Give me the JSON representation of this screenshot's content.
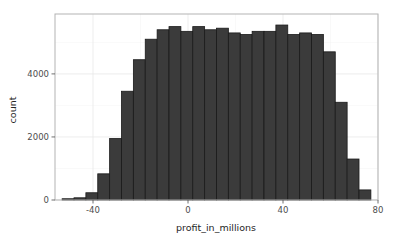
{
  "chart_data": {
    "type": "bar",
    "subtype": "histogram",
    "title": "",
    "xlabel": "profit_in_millions",
    "ylabel": "count",
    "xlim": [
      -56,
      80
    ],
    "ylim": [
      0,
      5900
    ],
    "x_ticks": [
      -40,
      0,
      40,
      80
    ],
    "x_tick_labels": [
      "-40",
      "0",
      "40",
      "80"
    ],
    "y_ticks": [
      0,
      2000,
      4000
    ],
    "y_tick_labels": [
      "0",
      "2000",
      "4000"
    ],
    "grid": true,
    "grid_color": "#e8e8e8",
    "legend": "none",
    "bar_fill": "#3b3b3b",
    "bar_edge": "#1a1a1a",
    "panel_border": "#b3b3b3",
    "background": "#ffffff",
    "bin_width": 5,
    "bin_edges": [
      -53,
      -48,
      -43,
      -38,
      -33,
      -28,
      -23,
      -18,
      -13,
      -8,
      -3,
      2,
      7,
      12,
      17,
      22,
      27,
      32,
      37,
      42,
      47,
      52,
      57,
      62,
      67,
      72,
      77
    ],
    "bin_centers": [
      -50.5,
      -45.5,
      -40.5,
      -35.5,
      -30.5,
      -25.5,
      -20.5,
      -15.5,
      -10.5,
      -5.5,
      -0.5,
      4.5,
      9.5,
      14.5,
      19.5,
      24.5,
      29.5,
      34.5,
      39.5,
      44.5,
      49.5,
      54.5,
      59.5,
      64.5,
      69.5,
      74.5
    ],
    "values": [
      40,
      70,
      230,
      830,
      1950,
      3450,
      4450,
      5100,
      5400,
      5500,
      5350,
      5500,
      5400,
      5450,
      5300,
      5250,
      5350,
      5350,
      5550,
      5250,
      5300,
      5250,
      4700,
      3100,
      1300,
      320
    ],
    "categories": [
      "-50.5",
      "-45.5",
      "-40.5",
      "-35.5",
      "-30.5",
      "-25.5",
      "-20.5",
      "-15.5",
      "-10.5",
      "-5.5",
      "-0.5",
      "4.5",
      "9.5",
      "14.5",
      "19.5",
      "24.5",
      "29.5",
      "34.5",
      "39.5",
      "44.5",
      "49.5",
      "54.5",
      "59.5",
      "64.5",
      "69.5",
      "74.5"
    ]
  },
  "axes": {
    "x_title": "profit_in_millions",
    "y_title": "count"
  }
}
